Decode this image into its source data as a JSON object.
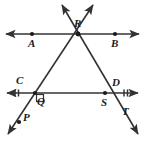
{
  "figure": {
    "background_color": "#ffffff",
    "stroke_color": "#333333",
    "label_color": "#1a1a1a",
    "width": 145,
    "height": 141
  },
  "points": [
    {
      "id": "A",
      "label": "A",
      "x": 32,
      "y": 34,
      "label_x": 30,
      "label_y": 46,
      "dot": true
    },
    {
      "id": "B",
      "label": "B",
      "x": 115,
      "y": 34,
      "label_x": 113,
      "label_y": 46,
      "dot": true
    },
    {
      "id": "R",
      "label": "R",
      "x": 78,
      "y": 34,
      "label_x": 76,
      "label_y": 27,
      "dot": true
    },
    {
      "id": "C",
      "label": "C",
      "x": 20,
      "y": 93,
      "label_x": 18,
      "label_y": 83,
      "dot": false
    },
    {
      "id": "D",
      "label": "D",
      "x": 118,
      "y": 93,
      "label_x": 115,
      "label_y": 85,
      "dot": false
    },
    {
      "id": "Q",
      "label": "Q",
      "x": 35,
      "y": 93,
      "label_x": 38,
      "label_y": 104,
      "dot": true
    },
    {
      "id": "S",
      "label": "S",
      "x": 105,
      "y": 93,
      "label_x": 103,
      "label_y": 105,
      "dot": true
    },
    {
      "id": "P",
      "label": "P",
      "x": 17,
      "y": 124,
      "label_x": 24,
      "label_y": 120,
      "dot": true
    },
    {
      "id": "T",
      "label": "T",
      "x": 127,
      "y": 118,
      "label_x": 124,
      "label_y": 114,
      "dot": false
    }
  ],
  "lines": [
    {
      "id": "AB",
      "name": "line-ab",
      "x1": 6,
      "y1": 34,
      "x2": 139,
      "y2": 34,
      "arrow_start": true,
      "arrow_end": true
    },
    {
      "id": "CD",
      "name": "line-cd",
      "x1": 7,
      "y1": 93,
      "x2": 138,
      "y2": 93,
      "arrow_start": true,
      "arrow_end": true
    },
    {
      "id": "PR",
      "name": "line-pr-transversal",
      "x1": 8,
      "y1": 134,
      "x2": 93,
      "y2": 5,
      "arrow_start": true,
      "arrow_end": true
    },
    {
      "id": "RT",
      "name": "line-rt-transversal",
      "x1": 62,
      "y1": 5,
      "x2": 138,
      "y2": 134,
      "arrow_start": true,
      "arrow_end": true
    }
  ],
  "marks": {
    "right_angle_at": "Q",
    "tick_marks_on": "CD",
    "tick_mark_note": "double tick marks near both ends of line CD"
  },
  "segments": {
    "triangle": [
      "R",
      "Q",
      "S"
    ]
  }
}
